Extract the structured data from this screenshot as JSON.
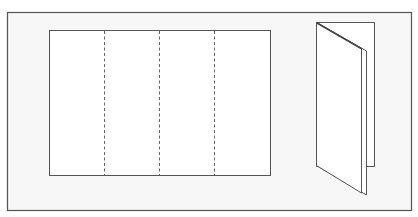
{
  "diagram": {
    "title": "",
    "colors": {
      "background": "#ffffff",
      "frame_fill": "#f7f7f7",
      "frame_stroke": "#555555",
      "sheet_fill": "#ffffff",
      "line_stroke": "#555555"
    },
    "flat_sheet": {
      "panels": 4,
      "fold_lines": 3,
      "fold_line_style": "dashed"
    },
    "folded_view": {
      "style": "folded booklet, standing"
    }
  }
}
